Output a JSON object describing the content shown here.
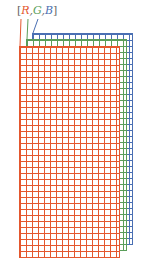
{
  "label": {
    "open": "[",
    "r": "R",
    "sep1": ",",
    "g": "G",
    "sep2": ",",
    "b": "B",
    "close": "]"
  },
  "colors": {
    "red": "#e4572e",
    "green": "#5a9e5a",
    "blue": "#4a6fb3",
    "bracket": "#666666"
  },
  "grids": [
    {
      "channel": "B",
      "left": 32,
      "top": 33,
      "width": 101,
      "height": 212,
      "cell": 6
    },
    {
      "channel": "G",
      "left": 26,
      "top": 39,
      "width": 101,
      "height": 212,
      "cell": 6
    },
    {
      "channel": "R",
      "left": 19,
      "top": 46,
      "width": 101,
      "height": 212,
      "cell": 6
    }
  ]
}
